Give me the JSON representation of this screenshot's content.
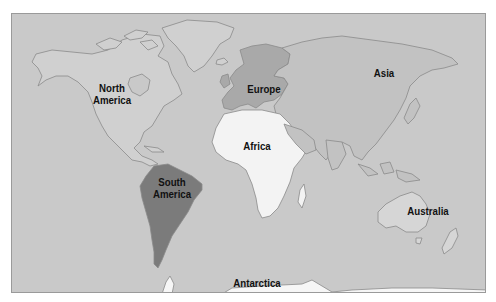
{
  "map": {
    "title": "World Continents Map",
    "colors": {
      "ocean": "#c9c9c9",
      "land_default": "#d0d0d0",
      "north_america": "#d0d0d0",
      "south_america": "#7b7b7b",
      "europe": "#a9a9a9",
      "asia": "#c2c2c2",
      "africa": "#f3f3f3",
      "australia": "#d6d6d6",
      "antarctica": "#f6f6f6",
      "outline": "#8a8a8a"
    },
    "labels": {
      "north_america_line1": "North",
      "north_america_line2": "America",
      "south_america_line1": "South",
      "south_america_line2": "America",
      "europe": "Europe",
      "asia": "Asia",
      "africa": "Africa",
      "australia": "Australia",
      "antarctica": "Antarctica"
    }
  }
}
